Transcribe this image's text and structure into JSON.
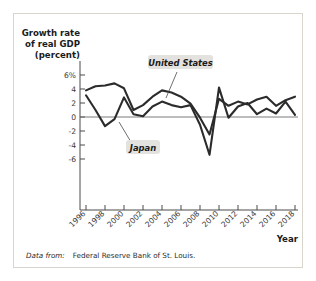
{
  "figure": {
    "source_prefix": "Data from:",
    "source_text": "Federal Reserve Bank of St. Louis.",
    "border_color": "#d9d4cc"
  },
  "chart_data": {
    "type": "line",
    "title": "",
    "ylabel_line1": "Growth rate",
    "ylabel_line2": "of real GDP",
    "ylabel_line3": "(percent)",
    "xlabel": "Year",
    "ylim": [
      -7,
      6.6
    ],
    "xlim": [
      1996,
      2018
    ],
    "grid": false,
    "legend_position": "inline-annotations",
    "ytick_labels": [
      "6%",
      "4",
      "2",
      "0",
      "-2",
      "-4",
      "-6"
    ],
    "ytick_values": [
      6,
      4,
      2,
      0,
      -2,
      -4,
      -6
    ],
    "xtick_labels": [
      "1996",
      "1998",
      "2000",
      "2002",
      "2004",
      "2006",
      "2008",
      "2010",
      "2012",
      "2014",
      "2016",
      "2018"
    ],
    "xtick_values": [
      1996,
      1998,
      2000,
      2002,
      2004,
      2006,
      2008,
      2010,
      2012,
      2014,
      2016,
      2018
    ],
    "x": [
      1996,
      1997,
      1998,
      1999,
      2000,
      2001,
      2002,
      2003,
      2004,
      2005,
      2006,
      2007,
      2008,
      2009,
      2010,
      2011,
      2012,
      2013,
      2014,
      2015,
      2016,
      2017,
      2018
    ],
    "series": [
      {
        "name": "United States",
        "color": "#2b2b2b",
        "values": [
          3.8,
          4.4,
          4.5,
          4.8,
          4.1,
          1.0,
          1.7,
          2.9,
          3.8,
          3.5,
          2.9,
          1.9,
          -0.1,
          -2.5,
          2.6,
          1.6,
          2.2,
          1.8,
          2.5,
          2.9,
          1.6,
          2.4,
          2.9
        ]
      },
      {
        "name": "Japan",
        "color": "#2b2b2b",
        "values": [
          3.1,
          1.0,
          -1.3,
          -0.3,
          2.8,
          0.4,
          0.1,
          1.5,
          2.2,
          1.7,
          1.4,
          1.7,
          -1.1,
          -5.4,
          4.2,
          -0.1,
          1.5,
          2.0,
          0.4,
          1.2,
          0.5,
          2.2,
          0.3
        ]
      }
    ],
    "annotations": [
      {
        "label": "United States",
        "points_to_year": 2004
      },
      {
        "label": "Japan",
        "points_to_year": 1999
      }
    ]
  }
}
